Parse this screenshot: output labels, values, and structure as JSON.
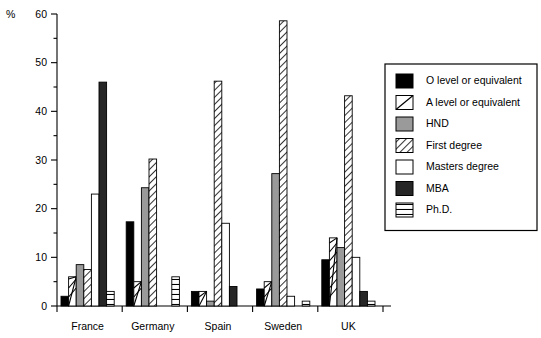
{
  "chart_data": {
    "type": "bar",
    "title": "",
    "xlabel": "",
    "ylabel": "%",
    "ylim": [
      0,
      60
    ],
    "ytick_values": [
      0,
      10,
      20,
      30,
      40,
      50,
      60
    ],
    "ytick_labels": [
      "0",
      "10",
      "20",
      "30",
      "40",
      "50",
      "60"
    ],
    "yminor_values": [
      5,
      15,
      25,
      35,
      45,
      55
    ],
    "grid": false,
    "legend_position": "right",
    "categories": [
      "France",
      "Germany",
      "Spain",
      "Sweden",
      "UK"
    ],
    "series": [
      {
        "name": "O level or equivalent",
        "pattern": "solid-black",
        "color": "#000000",
        "values": [
          2,
          17.3,
          3,
          3.5,
          9.5
        ]
      },
      {
        "name": "A level or equivalent",
        "pattern": "diagonal-single",
        "color": "#ffffff",
        "values": [
          6,
          5,
          3,
          5,
          14
        ]
      },
      {
        "name": "HND",
        "pattern": "solid-gray",
        "color": "#999999",
        "values": [
          8.5,
          24.3,
          1,
          27.2,
          12
        ]
      },
      {
        "name": "First degree",
        "pattern": "diagonal-hatch",
        "color": "#ffffff",
        "values": [
          7.5,
          30.2,
          46.2,
          58.6,
          43.2
        ]
      },
      {
        "name": "Masters degree",
        "pattern": "white",
        "color": "#ffffff",
        "values": [
          23,
          0,
          17,
          2,
          10
        ]
      },
      {
        "name": "MBA",
        "pattern": "solid-darkgray",
        "color": "#2b2b2b",
        "values": [
          46,
          0,
          4,
          0,
          3
        ]
      },
      {
        "name": "Ph.D.",
        "pattern": "horizontal-lines",
        "color": "#ffffff",
        "values": [
          3,
          6,
          0,
          1,
          1
        ]
      }
    ]
  },
  "legend": {
    "items": [
      {
        "label": "O level or equivalent"
      },
      {
        "label": "A level or equivalent"
      },
      {
        "label": "HND"
      },
      {
        "label": "First degree"
      },
      {
        "label": "Masters degree"
      },
      {
        "label": "MBA"
      },
      {
        "label": "Ph.D."
      }
    ]
  }
}
